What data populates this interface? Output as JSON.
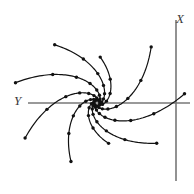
{
  "figure": {
    "width": 194,
    "height": 194,
    "background": "#ffffff",
    "type": "phase-portrait"
  },
  "axes": {
    "color": "#777777",
    "line_width": 1.6,
    "origin": {
      "x": 97,
      "y": 103
    },
    "horizontal": {
      "name": "Y",
      "x1": 28,
      "y1": 103,
      "x2": 190,
      "y2": 103
    },
    "vertical": {
      "name": "X",
      "x1": 176,
      "y1": 20,
      "x2": 176,
      "y2": 181
    },
    "labels": {
      "x_label": "X",
      "y_label": "Y"
    }
  },
  "chart_data": {
    "type": "line",
    "title": "",
    "xlabel": "Y",
    "ylabel": "X",
    "grid": false,
    "legend": null,
    "origin": [
      97,
      103
    ],
    "marker": {
      "shape": "circle",
      "radius": 1.7,
      "color": "#111111"
    },
    "curve": {
      "color": "#111111",
      "width": 1.2
    },
    "spiral_model": {
      "r0": 2.0,
      "growth": 0.255,
      "direction": "counterclockwise-outward",
      "samples_per_arm": 9
    },
    "series": [
      {
        "name": "arm-1",
        "start_angle_deg": 96,
        "sweep_deg": 150,
        "r_end": 64,
        "marker_count": 8
      },
      {
        "name": "arm-2",
        "start_angle_deg": 56,
        "sweep_deg": 150,
        "r_end": 80,
        "marker_count": 8
      },
      {
        "name": "arm-3",
        "start_angle_deg": 16,
        "sweep_deg": 150,
        "r_end": 84,
        "marker_count": 8
      },
      {
        "name": "arm-4",
        "start_angle_deg": -24,
        "sweep_deg": 150,
        "r_end": 72,
        "marker_count": 8
      },
      {
        "name": "arm-5",
        "start_angle_deg": -64,
        "sweep_deg": 150,
        "r_end": 46,
        "marker_count": 6
      },
      {
        "name": "arm-6",
        "start_angle_deg": -104,
        "sweep_deg": 150,
        "r_end": 78,
        "marker_count": 8
      },
      {
        "name": "arm-7",
        "start_angle_deg": -144,
        "sweep_deg": 150,
        "r_end": 88,
        "marker_count": 9
      },
      {
        "name": "arm-8",
        "start_angle_deg": 176,
        "sweep_deg": 150,
        "r_end": 72,
        "marker_count": 8
      },
      {
        "name": "arm-9",
        "start_angle_deg": 136,
        "sweep_deg": 150,
        "r_end": 42,
        "marker_count": 6
      }
    ]
  }
}
